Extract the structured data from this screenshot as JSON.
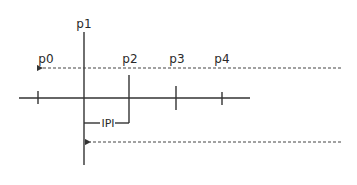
{
  "diagram": {
    "labels": {
      "p0": "p0",
      "p1": "p1",
      "p2": "p2",
      "p3": "p3",
      "p4": "p4",
      "interval": "IPI"
    },
    "colors": {
      "stroke": "#333333",
      "text": "#2a2a2a",
      "background": "#ffffff"
    },
    "arrows": [
      {
        "name": "top-dashed-arrow",
        "direction": "left",
        "points_to": "p0"
      },
      {
        "name": "bottom-dashed-arrow",
        "direction": "left",
        "points_to": "p1"
      }
    ]
  }
}
